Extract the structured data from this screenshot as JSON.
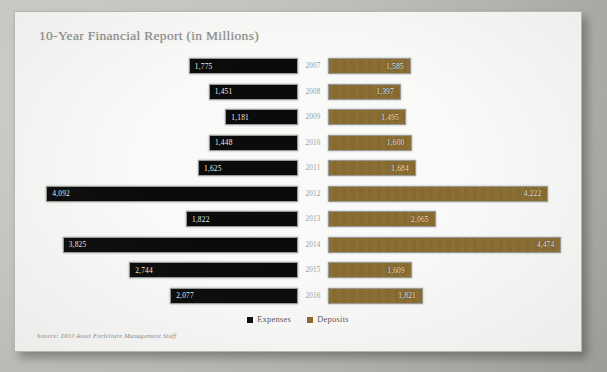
{
  "document": {
    "title": "10-Year Financial Report (in Millions)",
    "source_note": "Source: DOJ Asset Forfeiture Management Staff"
  },
  "legend": {
    "position": "bottom-center",
    "entries": [
      {
        "label": "Expenses",
        "color": "#0b0b0b",
        "icon": "square-swatch-icon"
      },
      {
        "label": "Deposits",
        "color": "#8a6b2d",
        "icon": "square-swatch-icon"
      }
    ]
  },
  "colors": {
    "expenses": "#0b0b0b",
    "deposits": "#8a6b2d",
    "title_text": "#8e8e8c",
    "year_text": "#9d9d99",
    "paper": "#fbfbfa",
    "backdrop": "#c8c8c3"
  },
  "chart_data": {
    "type": "bar",
    "subtype": "butterfly-tornado-diverging-horizontal",
    "title": "10-Year Financial Report (in Millions)",
    "subtitle": "",
    "xlabel": "",
    "ylabel": "",
    "units": "Millions",
    "grid": false,
    "legend_position": "bottom-center",
    "categories": [
      "2007",
      "2008",
      "2009",
      "2010",
      "2011",
      "2012",
      "2013",
      "2014",
      "2015",
      "2016"
    ],
    "series": [
      {
        "name": "Expenses",
        "direction": "left",
        "color": "#0b0b0b",
        "values": [
          1775,
          1451,
          1181,
          1448,
          1625,
          4092,
          1822,
          3825,
          2744,
          2077
        ],
        "labels": [
          "1,775",
          "1,451",
          "1,181",
          "1,448",
          "1,625",
          "4,092",
          "1,822",
          "3,825",
          "2,744",
          "2,077"
        ]
      },
      {
        "name": "Deposits",
        "direction": "right",
        "color": "#8a6b2d",
        "values": [
          1585,
          1397,
          1495,
          1600,
          1684,
          4222,
          2065,
          4474,
          1609,
          1821
        ],
        "labels": [
          "1,585",
          "1,397",
          "1,495",
          "1,600",
          "1,684",
          "4,222",
          "2,065",
          "4,474",
          "1,609",
          "1,821"
        ]
      }
    ],
    "xlim": [
      0,
      4600
    ],
    "annotations": [
      "Source: DOJ Asset Forfeiture Management Staff"
    ]
  },
  "rows": [
    {
      "year": "2007",
      "expenses": "1,775",
      "deposits": "1,585"
    },
    {
      "year": "2008",
      "expenses": "1,451",
      "deposits": "1,397"
    },
    {
      "year": "2009",
      "expenses": "1,181",
      "deposits": "1,495"
    },
    {
      "year": "2010",
      "expenses": "1,448",
      "deposits": "1,600"
    },
    {
      "year": "2011",
      "expenses": "1,625",
      "deposits": "1,684"
    },
    {
      "year": "2012",
      "expenses": "4,092",
      "deposits": "4,222"
    },
    {
      "year": "2013",
      "expenses": "1,822",
      "deposits": "2,065"
    },
    {
      "year": "2014",
      "expenses": "3,825",
      "deposits": "4,474"
    },
    {
      "year": "2015",
      "expenses": "2,744",
      "deposits": "1,609"
    },
    {
      "year": "2016",
      "expenses": "2,077",
      "deposits": "1,821"
    }
  ]
}
